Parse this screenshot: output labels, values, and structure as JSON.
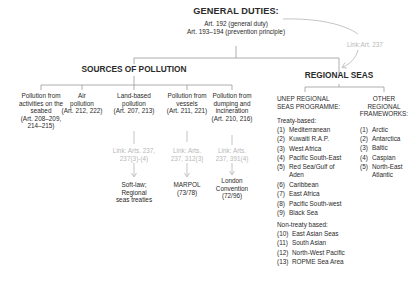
{
  "root": {
    "title": "GENERAL DUTIES:",
    "lines": [
      "Art. 192 (general duty)",
      "Art. 193–194 (prevention principle)"
    ]
  },
  "cross_link": {
    "label": "Link:Art. 237"
  },
  "sources": {
    "title": "SOURCES OF POLLUTION",
    "items": [
      {
        "lines": [
          "Pollution from",
          "activities on the",
          "seabed",
          "(Art. 208–209,",
          "214–215)"
        ]
      },
      {
        "lines": [
          "Air",
          "pollution",
          "(Art. 212, 222)"
        ]
      },
      {
        "lines": [
          "Land-based",
          "pollution",
          "(Art. 207, 213)"
        ],
        "link": [
          "Link: Arts. 237,",
          "237(3)-(4)"
        ],
        "result": [
          "Soft-law;",
          "Regional",
          "seas treaties"
        ]
      },
      {
        "lines": [
          "Pollution from",
          "vessels",
          "(Art. 211, 221)"
        ],
        "link": [
          "Link: Arts.",
          "237, 312(3)"
        ],
        "result": [
          "MARPOL",
          "(73/78)"
        ]
      },
      {
        "lines": [
          "Pollution from",
          "dumping and",
          "incineration",
          "(Art. 210, 216)"
        ],
        "link": [
          "Link: Arts.",
          "237, 391(4)"
        ],
        "result": [
          "London",
          "Convention",
          "(72/96)"
        ]
      }
    ]
  },
  "regional": {
    "title": "REGIONAL SEAS",
    "unep": {
      "heading": [
        "UNEP REGIONAL",
        "SEAS PROGRAMME:"
      ],
      "treaty_label": "Treaty-based:",
      "treaty": [
        {
          "n": "(1)",
          "name": "Mediterranean"
        },
        {
          "n": "(2)",
          "name": "Kuwaiti R.A.P."
        },
        {
          "n": "(3)",
          "name": "West Africa"
        },
        {
          "n": "(4)",
          "name": "Pacific South-East"
        },
        {
          "n": "(5)",
          "name": "Red Sea/Gulf of",
          "name2": "Aden"
        },
        {
          "n": "(6)",
          "name": "Caribbean"
        },
        {
          "n": "(7)",
          "name": "East Africa"
        },
        {
          "n": "(8)",
          "name": "Pacific South-west"
        },
        {
          "n": "(9)",
          "name": "Black Sea"
        }
      ],
      "nontreaty_label": "Non-treaty based:",
      "nontreaty": [
        {
          "n": "(10)",
          "name": "East Asian Seas"
        },
        {
          "n": "(11)",
          "name": "South Asian"
        },
        {
          "n": "(12)",
          "name": "North-West Pacific"
        },
        {
          "n": "(13)",
          "name": "ROPME Sea Area"
        }
      ]
    },
    "other": {
      "heading": [
        "OTHER",
        "REGIONAL",
        "FRAMEWORKS:"
      ],
      "items": [
        {
          "n": "(1)",
          "name": "Arctic"
        },
        {
          "n": "(2)",
          "name": "Antarctica"
        },
        {
          "n": "(3)",
          "name": "Baltic"
        },
        {
          "n": "(4)",
          "name": "Caspian"
        },
        {
          "n": "(5)",
          "name": "North-East",
          "name2": "Atlantic"
        }
      ]
    }
  },
  "colors": {
    "line": "#9a9a9a",
    "link_text": "#b8b8b8",
    "text": "#2a2a2a"
  }
}
